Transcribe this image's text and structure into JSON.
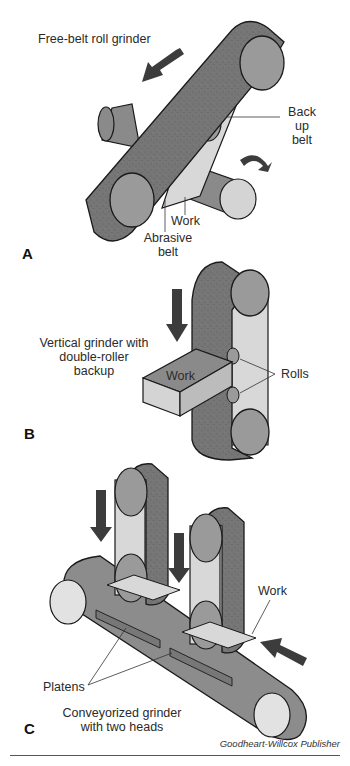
{
  "figure": {
    "credit": "Goodheart-Willcox Publisher",
    "colors": {
      "belt_dark": "#6a6a6a",
      "belt_mid": "#8c8c8c",
      "roll_face": "#9a9a9a",
      "light_face": "#d8d8d8",
      "arrow": "#3c3c3c",
      "outline": "#1a1a1a"
    },
    "panels": [
      {
        "letter": "A",
        "title": "Free-belt roll grinder",
        "labels": {
          "back_up_belt": "Back up belt",
          "back_up_line1": "Back up",
          "back_up_line2": "belt",
          "work": "Work",
          "abrasive_line1": "Abrasive",
          "abrasive_line2": "belt"
        }
      },
      {
        "letter": "B",
        "title_line1": "Vertical grinder with",
        "title_line2": "double-roller backup",
        "labels": {
          "work": "Work",
          "rolls": "Rolls"
        }
      },
      {
        "letter": "C",
        "title_line1": "Conveyorized grinder",
        "title_line2": "with two heads",
        "labels": {
          "work": "Work",
          "platens": "Platens"
        }
      }
    ]
  }
}
